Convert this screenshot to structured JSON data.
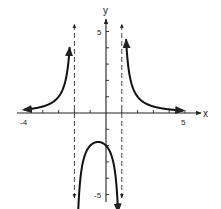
{
  "chart_data": {
    "type": "line",
    "title": "",
    "xlabel": "x",
    "ylabel": "y",
    "xlim": [
      -4,
      5
    ],
    "ylim": [
      -5,
      5
    ],
    "grid": false,
    "tick_labels": {
      "x": [
        "-4",
        "5"
      ],
      "y": [
        "5",
        "-5"
      ]
    },
    "x_ticks": [
      -4,
      -3,
      -2,
      -1,
      0,
      1,
      2,
      3,
      4,
      5
    ],
    "y_ticks": [
      -5,
      -4,
      -3,
      -2,
      -1,
      1,
      2,
      3,
      4,
      5
    ],
    "vertical_asymptotes": [
      -2,
      1
    ],
    "horizontal_asymptote": 0,
    "function": "f(x) = 4 / ((x + 2)(x - 1))",
    "series": [
      {
        "name": "left branch",
        "x": [
          -4.0,
          -3.5,
          -3.0,
          -2.75,
          -2.5,
          -2.4,
          -2.3
        ],
        "y": [
          0.4,
          0.59,
          1.0,
          1.42,
          2.29,
          2.94,
          3.75
        ]
      },
      {
        "name": "middle branch",
        "x": [
          -1.8,
          -1.5,
          -1.0,
          -0.5,
          0.0,
          0.5,
          0.8
        ],
        "y": [
          -4.17,
          -3.2,
          -2.0,
          -1.78,
          -2.0,
          -3.2,
          -4.17
        ]
      },
      {
        "name": "right branch",
        "x": [
          1.27,
          1.5,
          2.0,
          2.5,
          3.0,
          4.0,
          4.8
        ],
        "y": [
          4.53,
          2.29,
          1.0,
          0.59,
          0.4,
          0.22,
          0.15
        ]
      }
    ]
  }
}
